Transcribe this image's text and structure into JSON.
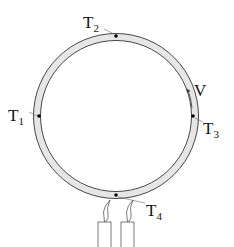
{
  "diagram": {
    "labels": {
      "t1": {
        "main": "T",
        "sub": "1"
      },
      "t2": {
        "main": "T",
        "sub": "2"
      },
      "t3": {
        "main": "T",
        "sub": "3"
      },
      "t4": {
        "main": "T",
        "sub": "4"
      },
      "v": "V"
    },
    "colors": {
      "tube_fill": "#e6e6e6",
      "stroke": "#333333"
    }
  }
}
